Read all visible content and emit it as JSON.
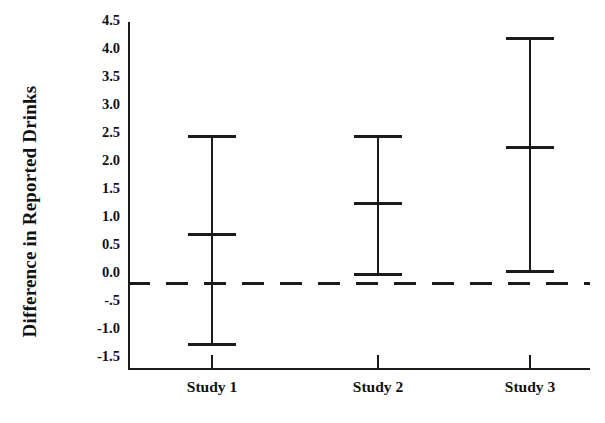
{
  "chart_data": {
    "type": "errorbar",
    "title": "",
    "xlabel": "",
    "ylabel": "Difference in Reported Drinks",
    "categories": [
      "Study 1",
      "Study 2",
      "Study 3"
    ],
    "values": [
      0.9,
      1.45,
      2.45
    ],
    "ci_lower": [
      -1.1,
      0.15,
      0.2
    ],
    "ci_upper": [
      2.65,
      2.65,
      4.4
    ],
    "ylim": [
      -1.75,
      4.75
    ],
    "ytick_labels": [
      "4.5",
      "4.0",
      "3.5",
      "3.0",
      "2.5",
      "2.0",
      "1.5",
      "1.0",
      "0.5",
      "0.0",
      "-.5",
      "-1.0",
      "-1.5"
    ],
    "ytick_values": [
      4.5,
      4.0,
      3.5,
      3.0,
      2.5,
      2.0,
      1.5,
      1.0,
      0.5,
      0.0,
      -0.5,
      -1.0,
      -1.5
    ],
    "reference_line": {
      "value": 0.0,
      "style": "dashed",
      "color": "#1b1b1b"
    },
    "grid": false,
    "legend": "none",
    "series": [
      {
        "name": "Difference in Reported Drinks",
        "points": [
          {
            "category": "Study 1",
            "mean": 0.9,
            "lower": -1.1,
            "upper": 2.65
          },
          {
            "category": "Study 2",
            "mean": 1.45,
            "lower": 0.15,
            "upper": 2.65
          },
          {
            "category": "Study 3",
            "mean": 2.45,
            "lower": 0.2,
            "upper": 4.4
          }
        ]
      }
    ],
    "colors": {
      "line": "#1b1b1b",
      "background": "#ffffff",
      "text": "#111111"
    }
  }
}
